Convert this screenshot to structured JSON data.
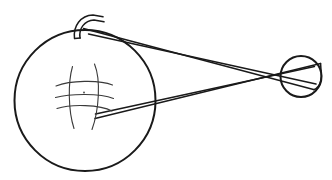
{
  "figure": {
    "background_color": "#ffffff",
    "line_color": "#1a1a1a",
    "fine_line_color": "#3a3a3a",
    "canvas": {
      "width": 332,
      "height": 180
    }
  },
  "chart_data": {
    "type": "diagram",
    "elements": [
      {
        "name": "driver-pulley",
        "shape": "circle",
        "cx": 85,
        "cy": 100,
        "r": 71,
        "stroke": "#1a1a1a",
        "stroke_width": 2,
        "fill": "#ffffff"
      },
      {
        "name": "driven-pulley",
        "shape": "circle",
        "cx": 301,
        "cy": 76,
        "r": 21,
        "stroke": "#1a1a1a",
        "stroke_width": 2,
        "fill": "#ffffff"
      },
      {
        "name": "belt-upper-span",
        "shape": "line",
        "x1": 84,
        "y1": 29,
        "x2": 318,
        "y2": 85,
        "stroke_width": 1.4
      },
      {
        "name": "belt-lower-span",
        "shape": "line",
        "x1": 96,
        "y1": 116,
        "x2": 320,
        "y2": 68,
        "stroke_width": 1.4
      },
      {
        "name": "belt-crossing-point",
        "shape": "point",
        "x": 240,
        "y": 82
      },
      {
        "name": "hub-center",
        "shape": "point",
        "x": 84,
        "y": 97
      }
    ],
    "hub_pattern": {
      "description": "curved crosshatch mesh at pulley hub",
      "vertical_curves": 2,
      "horizontal_curves": 3,
      "center_dot": true
    },
    "annotations": []
  },
  "captions": []
}
